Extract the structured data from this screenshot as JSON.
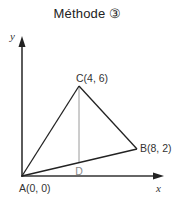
{
  "title": "Méthode ③",
  "axes": {
    "x_label": "x",
    "y_label": "y"
  },
  "points": {
    "A": {
      "label": "A(0, 0)",
      "x": 0,
      "y": 0
    },
    "B": {
      "label": "B(8, 2)",
      "x": 8,
      "y": 2
    },
    "C": {
      "label": "C(4, 6)",
      "x": 4,
      "y": 6
    },
    "D": {
      "label": "D"
    }
  },
  "colors": {
    "lines": "#222222",
    "helper_line": "#999999",
    "helper_label": "#888888"
  }
}
